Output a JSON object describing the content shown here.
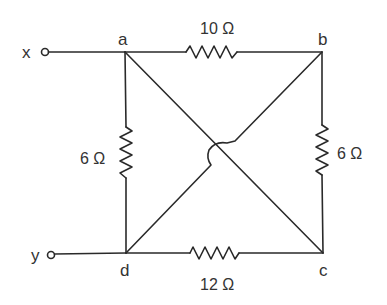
{
  "diagram": {
    "type": "circuit",
    "terminals": [
      {
        "id": "x",
        "label": "x"
      },
      {
        "id": "y",
        "label": "y"
      }
    ],
    "nodes": [
      {
        "id": "a",
        "label": "a"
      },
      {
        "id": "b",
        "label": "b"
      },
      {
        "id": "c",
        "label": "c"
      },
      {
        "id": "d",
        "label": "d"
      }
    ],
    "resistors": [
      {
        "id": "ab",
        "from": "a",
        "to": "b",
        "label": "10 Ω"
      },
      {
        "id": "bc",
        "from": "b",
        "to": "c",
        "label": "6 Ω"
      },
      {
        "id": "dc",
        "from": "d",
        "to": "c",
        "label": "12 Ω"
      },
      {
        "id": "ad",
        "from": "a",
        "to": "d",
        "label": "6 Ω"
      }
    ],
    "wires": [
      {
        "from": "x",
        "to": "a"
      },
      {
        "from": "y",
        "to": "d"
      },
      {
        "from": "a",
        "to": "c",
        "note": "diagonal"
      },
      {
        "from": "d",
        "to": "b",
        "note": "diagonal, hops over a-c"
      }
    ],
    "colors": {
      "line": "#2a2a2a",
      "text": "#333333",
      "background": "#ffffff"
    }
  }
}
